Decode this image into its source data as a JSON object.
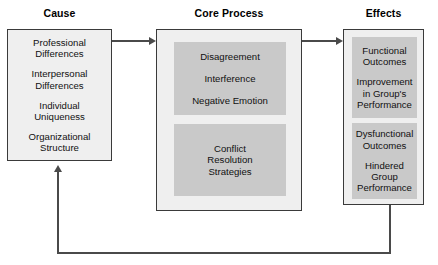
{
  "diagram": {
    "colors": {
      "outer_fill": "#efefef",
      "outer_border": "#3a3a3a",
      "inner_fill": "#c9c9c9",
      "connector": "#4a4a4a",
      "text": "#111111",
      "background": "#ffffff"
    },
    "columns": [
      {
        "id": "cause",
        "title": "Cause"
      },
      {
        "id": "core_process",
        "title": "Core Process"
      },
      {
        "id": "effects",
        "title": "Effects"
      }
    ],
    "cause": {
      "title": "Cause",
      "items": [
        "Professional\nDifferences",
        "Interpersonal\nDifferences",
        "Individual\nUniqueness",
        "Organizational\nStructure"
      ]
    },
    "core_process": {
      "title": "Core Process",
      "group_one": {
        "items": [
          "Disagreement",
          "Interference",
          "Negative Emotion"
        ]
      },
      "group_two": {
        "label": "Conflict\nResolution\nStrategies"
      }
    },
    "effects": {
      "title": "Effects",
      "functional": {
        "heading": "Functional\nOutcomes",
        "detail": "Improvement\nin Group's\nPerformance"
      },
      "dysfunctional": {
        "heading": "Dysfunctional\nOutcomes",
        "detail": "Hindered\nGroup\nPerformance"
      }
    },
    "connectors": [
      {
        "id": "cause-to-core",
        "from": "cause",
        "to": "core_process",
        "direction": "right"
      },
      {
        "id": "core-to-effects",
        "from": "core_process",
        "to": "effects",
        "direction": "right"
      },
      {
        "id": "effects-feedback-to-cause",
        "from": "effects",
        "to": "cause",
        "direction": "up"
      }
    ]
  }
}
